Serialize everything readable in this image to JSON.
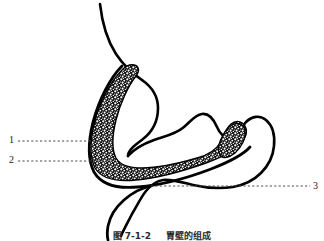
{
  "figure": {
    "type": "anatomical-line-diagram",
    "background_color": "#ffffff",
    "line_color": "#000000",
    "stipple_color": "#1c1c1c",
    "leader_color": "#4d4d4d",
    "width": 324,
    "height": 241
  },
  "caption": {
    "number": "图 7-1-2",
    "title": "胃壁的组成",
    "clipped": true
  },
  "callouts": [
    {
      "id": "1",
      "label": "1",
      "side": "left",
      "label_x": 9,
      "label_y": 140,
      "leader_from_x": 18,
      "leader_from_y": 141,
      "leader_to_x": 101,
      "leader_to_y": 141
    },
    {
      "id": "2",
      "label": "2",
      "side": "left",
      "label_x": 9,
      "label_y": 160,
      "leader_from_x": 18,
      "leader_from_y": 161,
      "leader_to_x": 112,
      "leader_to_y": 161
    },
    {
      "id": "3",
      "label": "3",
      "side": "right",
      "label_x": 313,
      "label_y": 186,
      "leader_from_x": 310,
      "leader_from_y": 186,
      "leader_to_x": 151,
      "leader_to_y": 186
    }
  ],
  "structures": [
    {
      "name": "esophagus",
      "description": "upper tube entering stomach from top"
    },
    {
      "name": "stomach-outer-wall",
      "description": "outer serosal outline"
    },
    {
      "name": "stomach-mucosa-band",
      "description": "stippled inner mucosal layer"
    },
    {
      "name": "duodenum",
      "description": "lower tube exiting toward bottom"
    }
  ]
}
